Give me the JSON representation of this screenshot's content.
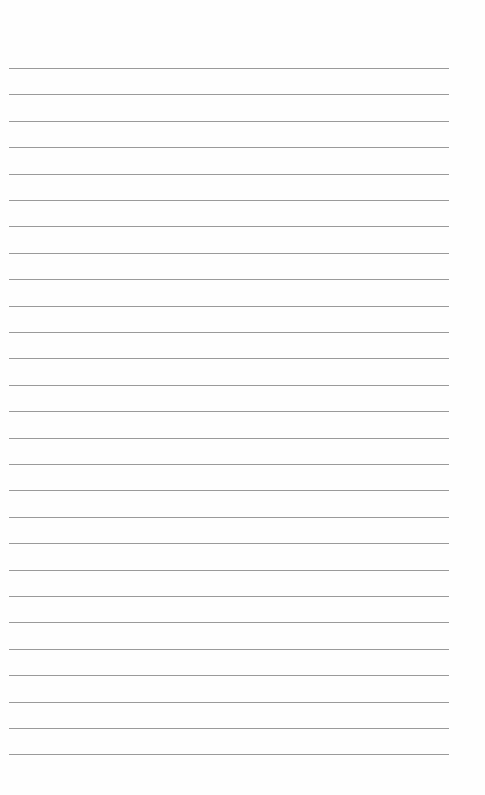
{
  "page": {
    "type": "lined-paper",
    "background": "#fefefe",
    "rule_color": "#9a9a9a",
    "rule_count": 27,
    "first_rule_y": 68,
    "rule_spacing": 26.4,
    "rule_left": 9,
    "rule_width": 440
  }
}
